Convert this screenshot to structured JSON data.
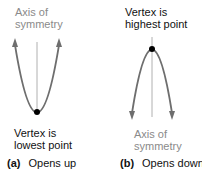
{
  "panel_a": {
    "axis_label_line1": "Axis of",
    "axis_label_line2": "symmetry",
    "vertex_label_line1": "Vertex is",
    "vertex_label_line2": "lowest point",
    "caption_letter": "(a)",
    "caption_text": "Opens up"
  },
  "panel_b": {
    "vertex_label_line1": "Vertex is",
    "vertex_label_line2": "highest point",
    "axis_label_line1": "Axis of",
    "axis_label_line2": "symmetry",
    "caption_letter": "(b)",
    "caption_text": "Opens down"
  },
  "colors": {
    "curve": "#6e6e6e",
    "axis_line": "#b0b0b0",
    "vertex": "#000000",
    "gray_text": "#8a8a8a"
  }
}
